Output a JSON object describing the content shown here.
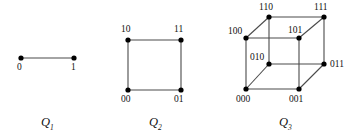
{
  "figure": {
    "background_color": "#ffffff",
    "edge_color": "#4a4a4a",
    "node_color": "#000000"
  },
  "graphs": [
    {
      "id": "Q1",
      "caption_base": "Q",
      "caption_sub": "1",
      "vertices": [
        {
          "label": "0",
          "x": 21,
          "y": 58
        },
        {
          "label": "1",
          "x": 74,
          "y": 58
        }
      ],
      "edges": [
        [
          0,
          1
        ]
      ]
    },
    {
      "id": "Q2",
      "caption_base": "Q",
      "caption_sub": "2",
      "vertices": [
        {
          "label": "10",
          "x": 128,
          "y": 40
        },
        {
          "label": "11",
          "x": 181,
          "y": 40
        },
        {
          "label": "00",
          "x": 128,
          "y": 90
        },
        {
          "label": "01",
          "x": 181,
          "y": 90
        }
      ],
      "edges": [
        [
          0,
          1
        ],
        [
          0,
          2
        ],
        [
          1,
          3
        ],
        [
          2,
          3
        ]
      ]
    },
    {
      "id": "Q3",
      "caption_base": "Q",
      "caption_sub": "3",
      "vertices": [
        {
          "label": "110",
          "x": 269,
          "y": 17
        },
        {
          "label": "111",
          "x": 324,
          "y": 17
        },
        {
          "label": "100",
          "x": 246,
          "y": 38
        },
        {
          "label": "101",
          "x": 299,
          "y": 38
        },
        {
          "label": "010",
          "x": 269,
          "y": 64
        },
        {
          "label": "011",
          "x": 324,
          "y": 64
        },
        {
          "label": "000",
          "x": 246,
          "y": 89
        },
        {
          "label": "001",
          "x": 299,
          "y": 89
        }
      ],
      "edges": [
        [
          0,
          1
        ],
        [
          0,
          2
        ],
        [
          0,
          4
        ],
        [
          1,
          3
        ],
        [
          1,
          5
        ],
        [
          2,
          3
        ],
        [
          2,
          6
        ],
        [
          3,
          7
        ],
        [
          4,
          5
        ],
        [
          4,
          6
        ],
        [
          5,
          7
        ],
        [
          6,
          7
        ]
      ]
    }
  ],
  "vertex_labels": {
    "q1": [
      {
        "text": "0",
        "x": 17,
        "y": 63
      },
      {
        "text": "1",
        "x": 71,
        "y": 63
      }
    ],
    "q2": [
      {
        "text": "10",
        "x": 121,
        "y": 25
      },
      {
        "text": "11",
        "x": 174,
        "y": 25
      },
      {
        "text": "00",
        "x": 121,
        "y": 95
      },
      {
        "text": "01",
        "x": 174,
        "y": 95
      }
    ],
    "q3": [
      {
        "text": "110",
        "x": 259,
        "y": 3
      },
      {
        "text": "111",
        "x": 314,
        "y": 3
      },
      {
        "text": "100",
        "x": 228,
        "y": 27
      },
      {
        "text": "101",
        "x": 288,
        "y": 26
      },
      {
        "text": "010",
        "x": 250,
        "y": 53
      },
      {
        "text": "011",
        "x": 330,
        "y": 60
      },
      {
        "text": "000",
        "x": 236,
        "y": 95
      },
      {
        "text": "001",
        "x": 289,
        "y": 95
      }
    ]
  },
  "captions": [
    {
      "base": "Q",
      "sub": "1",
      "x": 41,
      "y": 116
    },
    {
      "base": "Q",
      "sub": "2",
      "x": 149,
      "y": 116
    },
    {
      "base": "Q",
      "sub": "3",
      "x": 279,
      "y": 116
    }
  ]
}
